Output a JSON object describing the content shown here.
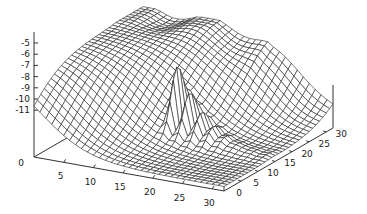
{
  "chart_data": {
    "type": "surface3d",
    "title": "",
    "xlabel": "",
    "ylabel": "",
    "zlabel": "",
    "x_ticks": [
      "0",
      "5",
      "10",
      "15",
      "20",
      "25",
      "30"
    ],
    "y_ticks": [
      "0",
      "5",
      "10",
      "15",
      "20",
      "25",
      "30"
    ],
    "z_ticks": [
      "-5",
      "-6",
      "-7",
      "-8",
      "-9",
      "-10",
      "-11"
    ],
    "xlim": [
      0,
      32
    ],
    "ylim": [
      0,
      32
    ],
    "zlim": [
      -12,
      -4.5
    ],
    "grid_size": [
      32,
      32
    ],
    "surface_samples": [
      {
        "x": 0,
        "y": 30,
        "z": -4.8
      },
      {
        "x": 5,
        "y": 30,
        "z": -4.7
      },
      {
        "x": 10,
        "y": 30,
        "z": -5.2
      },
      {
        "x": 15,
        "y": 30,
        "z": -5.6
      },
      {
        "x": 20,
        "y": 30,
        "z": -6.5
      },
      {
        "x": 0,
        "y": 20,
        "z": -5.5
      },
      {
        "x": 10,
        "y": 20,
        "z": -7.0
      },
      {
        "x": 15,
        "y": 15,
        "z": -9.5
      },
      {
        "x": 20,
        "y": 10,
        "z": -12.0
      },
      {
        "x": 30,
        "y": 0,
        "z": -12.0
      },
      {
        "x": 20,
        "y": 18,
        "z": -6.0
      },
      {
        "x": 25,
        "y": 20,
        "z": -10.0
      }
    ]
  }
}
